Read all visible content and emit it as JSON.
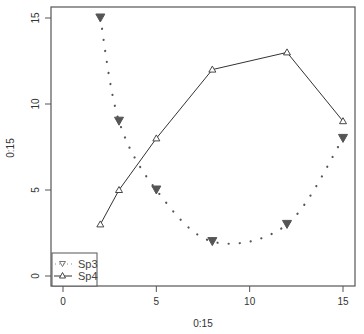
{
  "chart_data": {
    "type": "line",
    "title": "",
    "xlabel": "0:15",
    "ylabel": "0:15",
    "xlim": [
      -0.6,
      15.6
    ],
    "ylim": [
      -0.6,
      15.6
    ],
    "x_ticks": [
      "0",
      "5",
      "10",
      "15"
    ],
    "y_ticks": [
      "0",
      "5",
      "10",
      "15"
    ],
    "grid": false,
    "legend_position": "bottomleft",
    "series": [
      {
        "name": "Sp3",
        "style": "dotted smooth spline, filled down-triangle markers",
        "color": "#555555",
        "x": [
          2,
          3,
          5,
          8,
          12,
          15
        ],
        "y": [
          15,
          9,
          5,
          2,
          3,
          8
        ]
      },
      {
        "name": "Sp4",
        "style": "solid line, open up-triangle markers",
        "color": "#333333",
        "x": [
          2,
          3,
          5,
          8,
          12,
          15
        ],
        "y": [
          3,
          5,
          8,
          12,
          13,
          9
        ]
      }
    ]
  },
  "axes": {
    "xlabel": "0:15",
    "ylabel": "0:15",
    "x_ticks": [
      "0",
      "5",
      "10",
      "15"
    ],
    "y_ticks": [
      "0",
      "5",
      "10",
      "15"
    ]
  },
  "legend": {
    "items": [
      {
        "label": "Sp3",
        "icon": "down-triangle-dotted"
      },
      {
        "label": "Sp4",
        "icon": "up-triangle-line"
      }
    ]
  }
}
